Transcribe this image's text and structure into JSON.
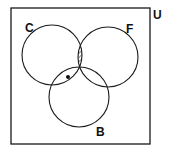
{
  "diagram": {
    "type": "venn",
    "universe_label": "U",
    "sets": [
      {
        "id": "C",
        "label": "C"
      },
      {
        "id": "F",
        "label": "F"
      },
      {
        "id": "B",
        "label": "B"
      }
    ],
    "shaded_region": "C ∩ F",
    "marked_point_region": "C ∩ B ∩ F'",
    "colors": {
      "stroke": "#1a1a1a",
      "background": "#ffffff",
      "hatch": "#333333"
    }
  }
}
